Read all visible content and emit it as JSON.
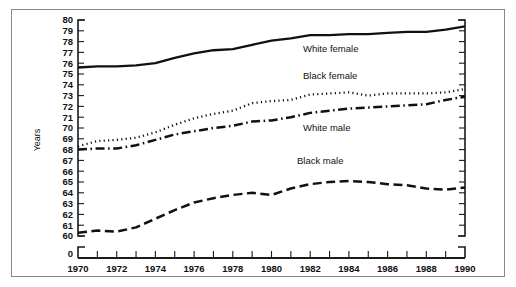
{
  "figure": {
    "background_color": "#ffffff",
    "frame_color": "#8a8a8a",
    "ink_color": "#111111"
  },
  "axis": {
    "y_title": "Years",
    "y_zero_label": "0",
    "y_labels": [
      "80",
      "79",
      "78",
      "77",
      "76",
      "75",
      "74",
      "73",
      "72",
      "71",
      "70",
      "69",
      "68",
      "67",
      "66",
      "65",
      "64",
      "63",
      "62",
      "61",
      "60"
    ],
    "x_labels": [
      "1970",
      "1972",
      "1974",
      "1976",
      "1978",
      "1980",
      "1982",
      "1984",
      "1986",
      "1988",
      "1990"
    ]
  },
  "series_labels": {
    "white_female": "White female",
    "black_female": "Black female",
    "white_male": "White male",
    "black_male": "Black male"
  },
  "chart_data": {
    "type": "line",
    "title": "",
    "subtitle": "",
    "xlabel": "",
    "ylabel": "Years",
    "xlim": [
      1970,
      1990
    ],
    "ylim": [
      60,
      80
    ],
    "y_axis_broken_at_zero": true,
    "y_tick_step": 1,
    "x_tick_step": 1,
    "x_label_step": 2,
    "grid": false,
    "legend_position": "inline-annotations",
    "x": [
      1970,
      1971,
      1972,
      1973,
      1974,
      1975,
      1976,
      1977,
      1978,
      1979,
      1980,
      1981,
      1982,
      1983,
      1984,
      1985,
      1986,
      1987,
      1988,
      1989,
      1990
    ],
    "series": [
      {
        "name": "White female",
        "line_style": "solid",
        "values": [
          75.6,
          75.7,
          75.7,
          75.8,
          76.0,
          76.5,
          76.9,
          77.2,
          77.3,
          77.7,
          78.1,
          78.3,
          78.6,
          78.6,
          78.7,
          78.7,
          78.8,
          78.9,
          78.9,
          79.1,
          79.4
        ]
      },
      {
        "name": "Black female",
        "line_style": "dotted",
        "values": [
          68.3,
          68.8,
          68.9,
          69.1,
          69.6,
          70.3,
          70.9,
          71.3,
          71.6,
          72.3,
          72.5,
          72.6,
          73.1,
          73.2,
          73.3,
          73.0,
          73.2,
          73.2,
          73.2,
          73.3,
          73.6
        ]
      },
      {
        "name": "White male",
        "line_style": "dash-dot",
        "values": [
          68.0,
          68.1,
          68.1,
          68.4,
          68.9,
          69.4,
          69.7,
          70.0,
          70.2,
          70.6,
          70.7,
          71.0,
          71.4,
          71.6,
          71.8,
          71.9,
          72.0,
          72.1,
          72.2,
          72.6,
          72.9
        ]
      },
      {
        "name": "Black male",
        "line_style": "dashed",
        "values": [
          60.3,
          60.5,
          60.4,
          60.8,
          61.6,
          62.4,
          63.1,
          63.5,
          63.8,
          64.0,
          63.8,
          64.4,
          64.8,
          65.0,
          65.1,
          65.0,
          64.8,
          64.7,
          64.4,
          64.3,
          64.5
        ]
      }
    ]
  }
}
